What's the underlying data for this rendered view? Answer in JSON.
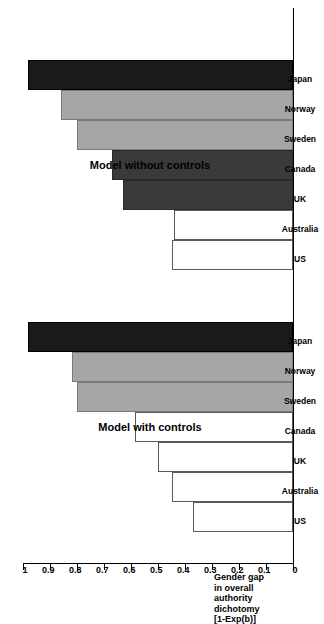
{
  "chart_data": {
    "type": "bar",
    "orientation": "horizontal",
    "title": "",
    "xlabel": "",
    "ylabel": "Gender gap in overall authority dichotomy [1-Exp(b)]",
    "ylabel_lines": [
      "Gender gap",
      "in overall",
      "authority",
      "dichotomy",
      "[1-Exp(b)]"
    ],
    "ylim": [
      0,
      1
    ],
    "tick_values": [
      1,
      0.9,
      0.8,
      0.7,
      0.6,
      0.5,
      0.4,
      0.3,
      0.2,
      0.1,
      0
    ],
    "tick_labels": [
      "1",
      "0.9",
      "0.8",
      "0.7",
      "0.6",
      "0.5",
      "0.4",
      "0.3",
      "0.2",
      "0.1",
      "0"
    ],
    "grid": false,
    "legend": "none",
    "categories": [
      "US",
      "Australia",
      "UK",
      "Canada",
      "Sweden",
      "Norway",
      "Japan"
    ],
    "groups": [
      {
        "name": "Model without controls",
        "title": "Model without controls",
        "bars": [
          {
            "category": "US",
            "value": 0.45,
            "fill": "white"
          },
          {
            "category": "Australia",
            "value": 0.44,
            "fill": "white"
          },
          {
            "category": "UK",
            "value": 0.63,
            "fill": "dark"
          },
          {
            "category": "Canada",
            "value": 0.67,
            "fill": "dark"
          },
          {
            "category": "Sweden",
            "value": 0.8,
            "fill": "gray"
          },
          {
            "category": "Norway",
            "value": 0.86,
            "fill": "gray"
          },
          {
            "category": "Japan",
            "value": 0.98,
            "fill": "black"
          }
        ]
      },
      {
        "name": "Model with controls",
        "title": "Model with controls",
        "bars": [
          {
            "category": "US",
            "value": 0.37,
            "fill": "white"
          },
          {
            "category": "Australia",
            "value": 0.45,
            "fill": "white"
          },
          {
            "category": "UK",
            "value": 0.5,
            "fill": "white"
          },
          {
            "category": "Canada",
            "value": 0.585,
            "fill": "white"
          },
          {
            "category": "Sweden",
            "value": 0.8,
            "fill": "gray"
          },
          {
            "category": "Norway",
            "value": 0.82,
            "fill": "gray"
          },
          {
            "category": "Japan",
            "value": 0.98,
            "fill": "black"
          }
        ]
      }
    ],
    "colors": {
      "black": "#1a1a1a",
      "dark": "#3a3a3a",
      "gray": "#a6a6a6",
      "white": "#ffffff",
      "axis": "#000000"
    }
  }
}
